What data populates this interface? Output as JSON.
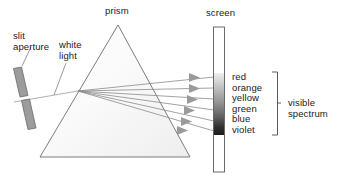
{
  "figure": {
    "type": "optics-ray-diagram"
  },
  "labels": {
    "prism": "prism",
    "screen": "screen",
    "slit_aperture": "slit\naperture",
    "white_light": "white\nlight",
    "visible_spectrum": "visible\nspectrum"
  },
  "spectrum": {
    "colors": "red\norange\nyellow\ngreen\nblue\nviolet",
    "color_list": [
      "red",
      "orange",
      "yellow",
      "green",
      "blue",
      "violet"
    ],
    "band_top_shade": "#efefef",
    "band_bottom_shade": "#1c1c1c"
  },
  "icons": {
    "ray_arrowhead": "arrowhead-right-icon",
    "slit_bar": "slit-bar-icon",
    "bracket": "bracket-icon"
  },
  "colors": {
    "outline": "#6e6e6e",
    "ray": "#8a8a8a",
    "arrowhead": "#9a9a9a",
    "slit_bar_fill": "#9c9c9c",
    "slit_bar_stroke": "#6a6a6a",
    "screen_stroke": "#5a5a5a",
    "text": "#1a1a1a"
  }
}
